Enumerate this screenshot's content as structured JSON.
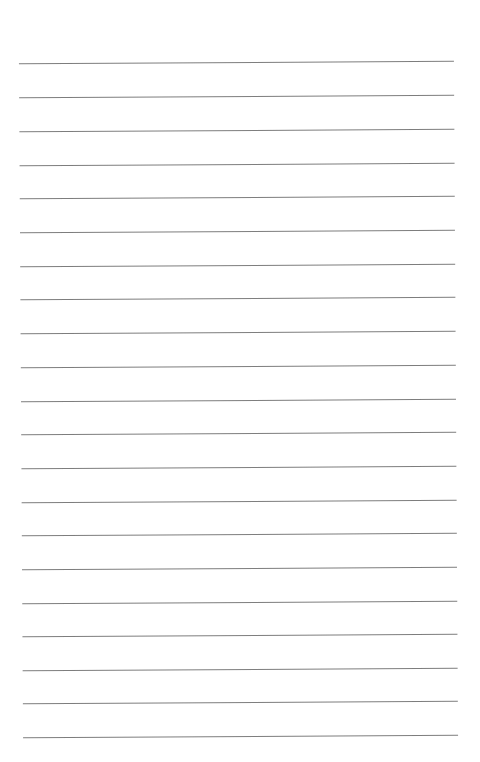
{
  "page": {
    "type": "lined-paper",
    "background_color": "#ffffff",
    "line_color": "#6f6f6f",
    "line_count": 21,
    "lines_y": [
      62,
      96,
      130,
      164,
      197,
      231,
      265,
      298,
      332,
      366,
      400,
      433,
      467,
      501,
      534,
      568,
      602,
      635,
      669,
      702,
      736
    ]
  }
}
